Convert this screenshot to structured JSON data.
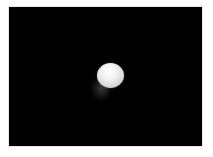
{
  "image": {
    "description": "White sphere on black background with faint gray shadow below-left",
    "background_color": "#000000",
    "border_color": "#ffffff",
    "subject": {
      "type": "sphere",
      "color": "#f0f0f0",
      "center": [
        101,
        68
      ],
      "approx_diameter_px": 26
    },
    "shadow": {
      "color": "#5a5a5a",
      "position": "below-left of sphere"
    }
  }
}
